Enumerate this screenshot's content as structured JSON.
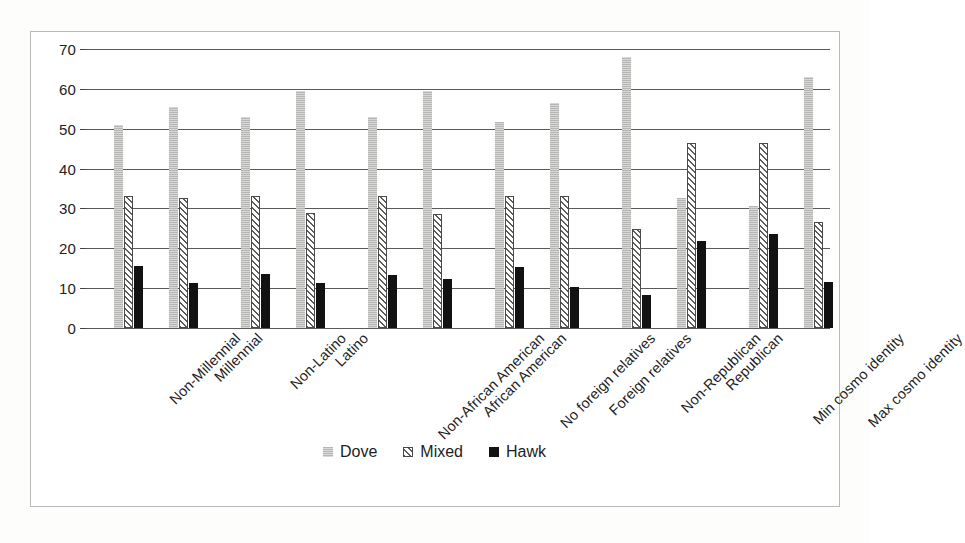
{
  "chart_data": {
    "type": "bar",
    "title": "",
    "subtitle": "",
    "xlabel": "",
    "ylabel": "Percent",
    "ylim": [
      0,
      70
    ],
    "yticks": [
      0,
      10,
      20,
      30,
      40,
      50,
      60,
      70
    ],
    "grid": true,
    "legend_position": "bottom",
    "orientation": "vertical",
    "grouped": true,
    "group_gaps_after": [
      1,
      3,
      5,
      7,
      9
    ],
    "categories": [
      "Non-Millennial",
      "Millennial",
      "Non-Latino",
      "Latino",
      "Non-African American",
      "African American",
      "No foreign relatives",
      "Foreign relatives",
      "Non-Republican",
      "Republican",
      "Min cosmo identity",
      "Max cosmo identity"
    ],
    "series": [
      {
        "name": "Dove",
        "color": "#b6b6b4",
        "pattern": "dotted-solid",
        "values": [
          51,
          55.5,
          53,
          59.5,
          53,
          59.5,
          51.8,
          56.5,
          68,
          32.5,
          30.5,
          63
        ]
      },
      {
        "name": "Mixed",
        "color": "#5c5c5c",
        "pattern": "diagonal-hatch",
        "values": [
          33,
          32.5,
          33,
          28.8,
          33.2,
          28.7,
          33,
          33.2,
          24.8,
          46.3,
          46.3,
          26.5
        ]
      },
      {
        "name": "Hawk",
        "color": "#121212",
        "pattern": "solid",
        "values": [
          15.5,
          11.2,
          13.6,
          11.2,
          13.4,
          12.2,
          15.3,
          10.2,
          8.2,
          21.8,
          23.6,
          11.5
        ]
      }
    ]
  },
  "legend": {
    "items": [
      {
        "label": "Dove"
      },
      {
        "label": "Mixed"
      },
      {
        "label": "Hawk"
      }
    ]
  },
  "axis": {
    "y_title": "Percent",
    "tick_labels": [
      "70",
      "60",
      "50",
      "40",
      "30",
      "20",
      "10",
      "0"
    ]
  }
}
